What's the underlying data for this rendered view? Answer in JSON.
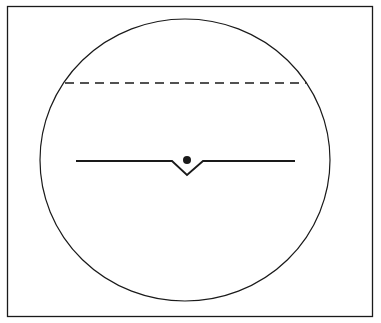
{
  "diagram": {
    "width": 381,
    "height": 323,
    "colors": {
      "background": "#ffffff",
      "stroke": "#1a1a1a"
    },
    "frame": {
      "x": 7.5,
      "y": 6.5,
      "width": 365,
      "height": 310
    },
    "circle": {
      "cx": 185,
      "cy": 160,
      "rx": 145,
      "ry": 141
    },
    "dashed_line": {
      "x1": 65,
      "y1": 83,
      "x2": 306,
      "y2": 83,
      "dash": "9,6"
    },
    "solid_line": {
      "points": "76,161 172,161 187,175 203,161 295,161"
    },
    "dot": {
      "cx": 187,
      "cy": 160,
      "r": 4
    }
  }
}
